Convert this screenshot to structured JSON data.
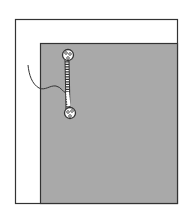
{
  "diagram": {
    "title": "",
    "colors": {
      "background": "#ffffff",
      "fabric": "#a9a9a9",
      "outline": "#333333",
      "stitch_fill": "#ffffff"
    },
    "elements": [
      "outer-panel",
      "fabric-layer",
      "bar-tack-stitch",
      "thread-tail"
    ]
  }
}
